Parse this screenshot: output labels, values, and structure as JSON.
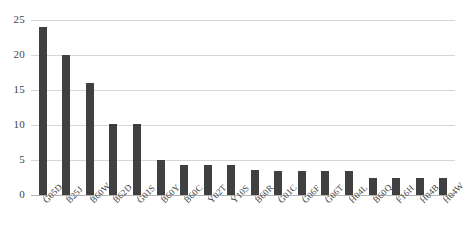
{
  "chart_data": {
    "type": "bar",
    "title": "",
    "subtitle": "",
    "xlabel": "",
    "ylabel": "",
    "ylim": [
      0,
      25
    ],
    "yticks": [
      0,
      5,
      10,
      15,
      20,
      25
    ],
    "grid": true,
    "legend": false,
    "legend_position": "none",
    "bar_color": "#404040",
    "gridline_color": "#d6d6d6",
    "categories": [
      "G05D",
      "B25J",
      "B60W",
      "B62D",
      "G01S",
      "B60Y",
      "B60C",
      "Y02T",
      "Y10S",
      "B60R",
      "G01C",
      "G06F",
      "G06T",
      "H04L",
      "B60Q",
      "F16H",
      "H04B",
      "H04W"
    ],
    "values": [
      24.0,
      20.0,
      16.0,
      10.1,
      10.1,
      5.0,
      4.3,
      4.3,
      4.3,
      3.6,
      3.4,
      3.4,
      3.4,
      3.4,
      2.4,
      2.4,
      2.4,
      2.4
    ]
  }
}
